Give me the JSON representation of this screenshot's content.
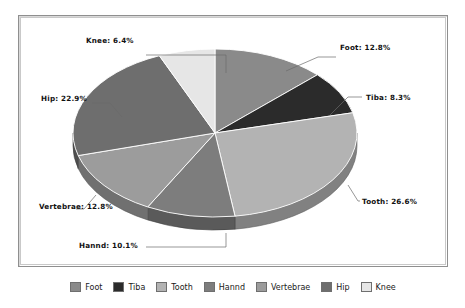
{
  "chart_data": {
    "type": "pie",
    "title": "",
    "categories": [
      "Foot",
      "Tiba",
      "Tooth",
      "Hannd",
      "Vertebrae",
      "Hip",
      "Knee"
    ],
    "values": [
      12.8,
      8.3,
      26.6,
      10.1,
      12.8,
      22.9,
      6.4
    ],
    "unit": "%",
    "legend_position": "bottom",
    "three_d": true,
    "start_angle_deg": 0,
    "direction": "clockwise",
    "colors": [
      "#8a8a8a",
      "#2b2b2b",
      "#b3b3b3",
      "#7d7d7d",
      "#9c9c9c",
      "#6e6e6e",
      "#e6e6e6"
    ],
    "slices": [
      {
        "label": "Foot",
        "value": 12.8,
        "color": "#8a8a8a",
        "callout": "Foot: 12.8%"
      },
      {
        "label": "Tiba",
        "value": 8.3,
        "color": "#2b2b2b",
        "callout": "Tiba: 8.3%"
      },
      {
        "label": "Tooth",
        "value": 26.6,
        "color": "#b3b3b3",
        "callout": "Tooth: 26.6%"
      },
      {
        "label": "Hannd",
        "value": 10.1,
        "color": "#7d7d7d",
        "callout": "Hannd: 10.1%"
      },
      {
        "label": "Vertebrae",
        "value": 12.8,
        "color": "#9c9c9c",
        "callout": "Vertebrae: 12.8%"
      },
      {
        "label": "Hip",
        "value": 22.9,
        "color": "#6e6e6e",
        "callout": "Hip: 22.9%"
      },
      {
        "label": "Knee",
        "value": 6.4,
        "color": "#e6e6e6",
        "callout": "Knee: 6.4%"
      }
    ]
  },
  "callouts": {
    "foot": "Foot: 12.8%",
    "tiba": "Tiba: 8.3%",
    "tooth": "Tooth: 26.6%",
    "hannd": "Hannd: 10.1%",
    "vertebrae": "Vertebrae: 12.8%",
    "hip": "Hip: 22.9%",
    "knee": "Knee: 6.4%"
  },
  "legend": {
    "items": [
      {
        "label": "Foot",
        "color": "#8a8a8a"
      },
      {
        "label": "Tiba",
        "color": "#2b2b2b"
      },
      {
        "label": "Tooth",
        "color": "#b3b3b3"
      },
      {
        "label": "Hannd",
        "color": "#7d7d7d"
      },
      {
        "label": "Vertebrae",
        "color": "#9c9c9c"
      },
      {
        "label": "Hip",
        "color": "#6e6e6e"
      },
      {
        "label": "Knee",
        "color": "#e6e6e6"
      }
    ]
  },
  "style": {
    "frame_border": "#8f8f8f",
    "background": "#ffffff",
    "leader_line": "#6a6a6a",
    "slice_edge": "#ffffff"
  }
}
